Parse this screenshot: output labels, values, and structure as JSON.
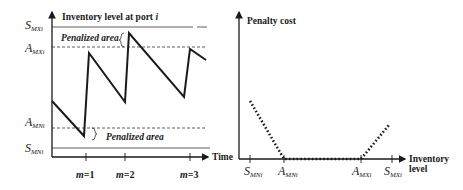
{
  "left_chart": {
    "title": "Inventory level at port ",
    "title_var": "i",
    "x_axis_label": "Time",
    "levels": {
      "S_MX": {
        "main": "S",
        "sub": "MXi"
      },
      "A_MX": {
        "main": "A",
        "sub": "MXi"
      },
      "A_MN": {
        "main": "A",
        "sub": "MNi"
      },
      "S_MN": {
        "main": "S",
        "sub": "MNi"
      }
    },
    "upper_penalized_label": "Penalized area",
    "lower_penalized_label": "Penalized area",
    "ticks": [
      {
        "label_var": "m",
        "label_val": "=1"
      },
      {
        "label_var": "m",
        "label_val": "=2"
      },
      {
        "label_var": "m",
        "label_val": "=3"
      }
    ]
  },
  "right_chart": {
    "y_axis_label": "Penalty cost",
    "x_axis_label_line1": "Inventory",
    "x_axis_label_line2": "level",
    "ticks": [
      {
        "main": "S",
        "sub": "MNi"
      },
      {
        "main": "A",
        "sub": "MNi"
      },
      {
        "main": "A",
        "sub": "MXi"
      },
      {
        "main": "S",
        "sub": "MXi"
      }
    ]
  },
  "colors": {
    "line": "#1a1a1a",
    "grid": "#333333",
    "background": "#ffffff"
  }
}
